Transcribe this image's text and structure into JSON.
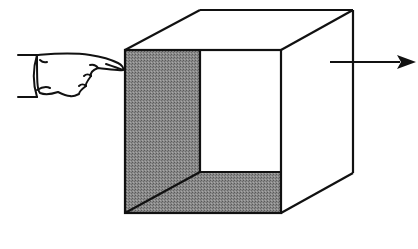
{
  "diagram": {
    "description": "Open-faced box (cube) viewed in perspective with a hand pointing at its left inner wall and an arrow pointing right",
    "elements": {
      "hand": "pointing-hand-icon",
      "box": "open-cube",
      "arrow": "right-arrow"
    },
    "colors": {
      "stroke": "#111111",
      "shade": "#7a7a7a",
      "background": "#ffffff"
    }
  }
}
